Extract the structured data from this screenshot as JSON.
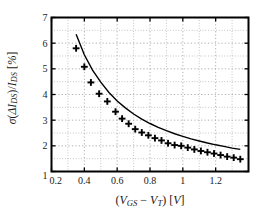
{
  "figure": {
    "background": "#ffffff",
    "frame_color": "#000000",
    "grid_color": "#9a9a9a",
    "marker_color": "#000000",
    "curve_color": "#000000"
  },
  "axis_labels": {
    "x_parts": {
      "open": "(",
      "v1": "V",
      "v1sub": "GS",
      "minus": "−",
      "v2": "V",
      "v2sub": "T",
      "close": ")",
      "unit_open": "[",
      "unit": "V",
      "unit_close": "]"
    },
    "y_parts": {
      "sigma": "σ",
      "open": "(",
      "delta": "Δ",
      "i1": "I",
      "i1sub": "DS",
      "close": ")",
      "slash": "/",
      "i2": "I",
      "i2sub": "DS",
      "unit_open": "[",
      "unit": "%",
      "unit_close": "]"
    },
    "x_plain": "(VGS − VT) [V]",
    "y_plain": "σ(ΔIDS)/IDS [%]"
  },
  "chart_data": {
    "type": "scatter",
    "title": "",
    "xlabel": "(V_GS - V_T) [V]",
    "ylabel": "sigma(Delta I_DS)/I_DS [%]",
    "xlim": [
      0.2,
      1.4
    ],
    "ylim": [
      1,
      7
    ],
    "xticks": [
      0.2,
      0.4,
      0.6,
      0.8,
      1.0,
      1.2
    ],
    "xticklabels": [
      "0.2",
      "0.4",
      "0.6",
      "0.8",
      "1",
      "1.2"
    ],
    "yticks": [
      1,
      2,
      3,
      4,
      5,
      6,
      7
    ],
    "yticklabels": [
      "1",
      "2",
      "3",
      "4",
      "5",
      "6",
      "7"
    ],
    "grid": true,
    "grid_style": "dotted",
    "minor_grid": true,
    "legend": null,
    "series": [
      {
        "name": "measured",
        "type": "scatter",
        "marker": "plus",
        "color": "#000000",
        "x": [
          0.35,
          0.4,
          0.44,
          0.49,
          0.54,
          0.59,
          0.63,
          0.67,
          0.71,
          0.75,
          0.79,
          0.83,
          0.87,
          0.91,
          0.95,
          0.99,
          1.03,
          1.07,
          1.11,
          1.15,
          1.19,
          1.23,
          1.27,
          1.31,
          1.35
        ],
        "y": [
          5.8,
          5.08,
          4.47,
          4.03,
          3.73,
          3.33,
          3.06,
          2.86,
          2.65,
          2.52,
          2.41,
          2.3,
          2.21,
          2.1,
          2.03,
          2.0,
          1.93,
          1.86,
          1.8,
          1.75,
          1.7,
          1.64,
          1.58,
          1.54,
          1.48
        ]
      },
      {
        "name": "model",
        "type": "line",
        "color": "#000000",
        "x": [
          0.35,
          0.4,
          0.45,
          0.5,
          0.55,
          0.6,
          0.65,
          0.7,
          0.75,
          0.8,
          0.85,
          0.9,
          0.95,
          1.0,
          1.05,
          1.1,
          1.15,
          1.2,
          1.25,
          1.3,
          1.35
        ],
        "y": [
          6.35,
          5.55,
          4.95,
          4.48,
          4.08,
          3.75,
          3.48,
          3.24,
          3.04,
          2.87,
          2.72,
          2.59,
          2.47,
          2.37,
          2.27,
          2.19,
          2.11,
          2.04,
          1.98,
          1.91,
          1.86
        ]
      }
    ]
  }
}
